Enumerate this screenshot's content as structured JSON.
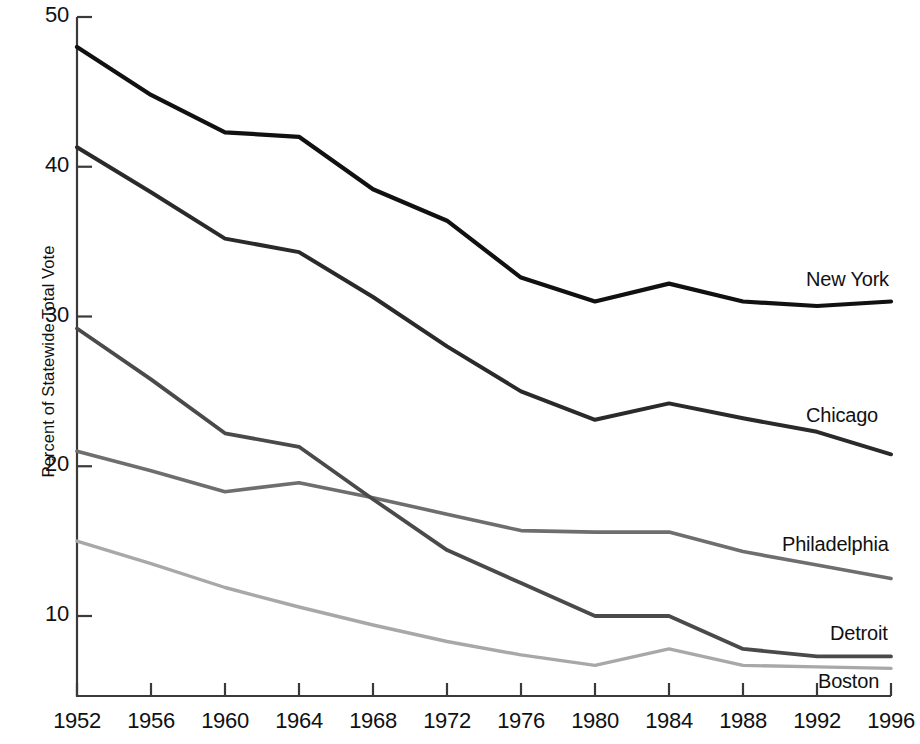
{
  "chart_data": {
    "type": "line",
    "title": "",
    "xlabel": "",
    "ylabel": "Percent of Statewide Total Vote",
    "x": [
      1952,
      1956,
      1960,
      1964,
      1968,
      1972,
      1976,
      1980,
      1984,
      1988,
      1992,
      1996
    ],
    "xtick_labels": [
      "1952",
      "1956",
      "1960",
      "1964",
      "1968",
      "1972",
      "1976",
      "1980",
      "1984",
      "1988",
      "1992",
      "1996"
    ],
    "ytick_labels": [
      "50",
      "40",
      "30",
      "20",
      "10"
    ],
    "ytick_values": [
      50,
      40,
      30,
      20,
      10
    ],
    "ylim": [
      4.5,
      50
    ],
    "xlim": [
      1952,
      1996
    ],
    "grid": false,
    "legend_position": "right-inline-labels",
    "series": [
      {
        "name": "New York",
        "color": "#111111",
        "width": 4.2,
        "values": [
          48.0,
          44.8,
          42.3,
          42.0,
          38.5,
          36.4,
          32.6,
          31.0,
          32.2,
          31.0,
          30.7,
          31.0
        ]
      },
      {
        "name": "Chicago",
        "color": "#2a2a2a",
        "width": 4.0,
        "values": [
          41.3,
          38.3,
          35.2,
          34.3,
          31.3,
          28.0,
          25.0,
          23.1,
          24.2,
          23.2,
          22.3,
          20.8
        ]
      },
      {
        "name": "Philadelphia",
        "color": "#6e6e6e",
        "width": 3.6,
        "values": [
          21.0,
          19.7,
          18.3,
          18.9,
          17.9,
          16.8,
          15.7,
          15.6,
          15.6,
          14.3,
          13.4,
          12.5
        ]
      },
      {
        "name": "Detroit",
        "color": "#4a4a4a",
        "width": 3.8,
        "values": [
          29.2,
          25.8,
          22.2,
          21.3,
          17.8,
          14.4,
          12.2,
          10.0,
          10.0,
          7.8,
          7.3,
          7.3
        ]
      },
      {
        "name": "Boston",
        "color": "#a8a8a8",
        "width": 3.4,
        "values": [
          15.0,
          13.5,
          11.9,
          10.6,
          9.4,
          8.3,
          7.4,
          6.7,
          7.8,
          6.7,
          6.6,
          6.5
        ]
      }
    ]
  },
  "axis": {
    "y_title": "Percent of Statewide Total Vote"
  },
  "series_labels": [
    {
      "name": "New York",
      "x": 806,
      "y": 268
    },
    {
      "name": "Chicago",
      "x": 806,
      "y": 404
    },
    {
      "name": "Philadelphia",
      "x": 782,
      "y": 533
    },
    {
      "name": "Detroit",
      "x": 830,
      "y": 622
    },
    {
      "name": "Boston",
      "x": 818,
      "y": 670
    }
  ]
}
